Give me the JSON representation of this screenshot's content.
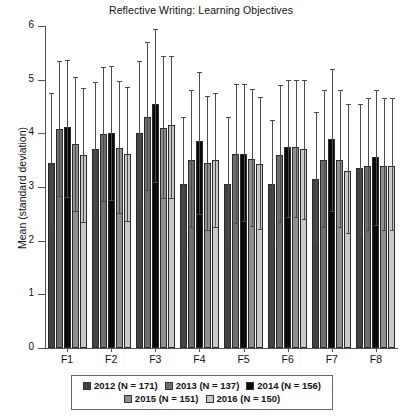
{
  "chart_data": {
    "type": "bar",
    "title": "Reflective Writing: Learning Objectives",
    "xlabel": "",
    "ylabel": "Mean (standard deviation)",
    "ylim": [
      0,
      6
    ],
    "yticks": [
      0,
      1,
      2,
      3,
      4,
      5,
      6
    ],
    "grid": false,
    "legend_position": "bottom",
    "error_bars": "standard deviation",
    "categories": [
      "F1",
      "F2",
      "F3",
      "F4",
      "F5",
      "F6",
      "F7",
      "F8"
    ],
    "series": [
      {
        "name": "2012 (N = 171)",
        "color": "#434343",
        "values": [
          3.45,
          3.7,
          4.0,
          3.05,
          3.05,
          3.05,
          3.15,
          3.35
        ],
        "err_low": [
          1.25,
          1.2,
          1.25,
          1.2,
          1.15,
          1.15,
          1.15,
          1.2
        ],
        "err_high": [
          1.3,
          1.25,
          1.35,
          1.25,
          1.25,
          1.2,
          1.25,
          1.2
        ]
      },
      {
        "name": "2013 (N = 137)",
        "color": "#6e6e6e",
        "values": [
          4.08,
          3.98,
          4.3,
          3.5,
          3.62,
          3.6,
          3.5,
          3.4
        ],
        "err_low": [
          1.25,
          1.25,
          1.35,
          1.25,
          1.3,
          1.25,
          1.25,
          1.2
        ],
        "err_high": [
          1.27,
          1.25,
          1.4,
          1.3,
          1.3,
          1.3,
          1.3,
          1.25
        ]
      },
      {
        "name": "2014 (N = 156)",
        "color": "#0a0a0a",
        "values": [
          4.12,
          4.0,
          4.55,
          3.85,
          3.62,
          3.75,
          3.9,
          3.55
        ],
        "err_low": [
          1.3,
          1.25,
          1.45,
          1.35,
          1.25,
          1.3,
          1.35,
          1.25
        ],
        "err_high": [
          1.25,
          1.25,
          1.4,
          1.3,
          1.3,
          1.25,
          1.3,
          1.25
        ]
      },
      {
        "name": "2015 (N = 151)",
        "color": "#8f8f8f",
        "values": [
          3.8,
          3.72,
          4.1,
          3.45,
          3.52,
          3.75,
          3.5,
          3.4
        ],
        "err_low": [
          1.25,
          1.2,
          1.3,
          1.25,
          1.25,
          1.3,
          1.25,
          1.2
        ],
        "err_high": [
          1.25,
          1.25,
          1.35,
          1.25,
          1.3,
          1.25,
          1.3,
          1.25
        ]
      },
      {
        "name": "2016 (N = 150)",
        "color": "#c8c8c8",
        "values": [
          3.6,
          3.62,
          4.15,
          3.5,
          3.42,
          3.7,
          3.3,
          3.4
        ],
        "err_low": [
          1.25,
          1.25,
          1.35,
          1.25,
          1.2,
          1.3,
          1.15,
          1.2
        ],
        "err_high": [
          1.25,
          1.25,
          1.3,
          1.25,
          1.25,
          1.3,
          1.25,
          1.25
        ]
      }
    ]
  },
  "legend": {
    "rows": [
      [
        "2012 (N = 171)",
        "2013 (N = 137)",
        "2014 (N = 156)"
      ],
      [
        "2015 (N = 151)",
        "2016 (N = 150)"
      ]
    ]
  }
}
